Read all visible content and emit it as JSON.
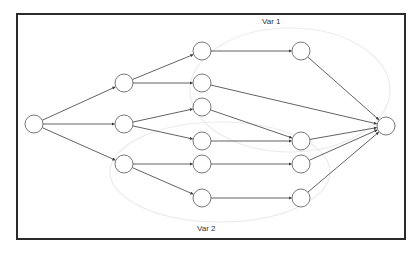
{
  "diagram": {
    "type": "directed-graph",
    "labels": {
      "group_top": "Var 1",
      "group_bottom": "Var 2"
    },
    "colors": {
      "frame": "#2b2b2b",
      "edge": "#3a3a3a",
      "node_stroke": "#555555",
      "node_fill": "#ffffff",
      "group_outline": "#ececec"
    },
    "node_radius": 9,
    "nodes": [
      {
        "id": "A",
        "x": 34,
        "y": 124
      },
      {
        "id": "B1",
        "x": 124,
        "y": 83
      },
      {
        "id": "B2",
        "x": 124,
        "y": 124
      },
      {
        "id": "B3",
        "x": 124,
        "y": 164
      },
      {
        "id": "C1",
        "x": 202,
        "y": 51
      },
      {
        "id": "C2",
        "x": 202,
        "y": 83
      },
      {
        "id": "C3",
        "x": 202,
        "y": 107
      },
      {
        "id": "C4",
        "x": 202,
        "y": 141
      },
      {
        "id": "C5",
        "x": 202,
        "y": 164
      },
      {
        "id": "C6",
        "x": 202,
        "y": 198
      },
      {
        "id": "D1",
        "x": 301,
        "y": 51
      },
      {
        "id": "D2",
        "x": 301,
        "y": 141
      },
      {
        "id": "D3",
        "x": 301,
        "y": 164
      },
      {
        "id": "D4",
        "x": 301,
        "y": 198
      },
      {
        "id": "E",
        "x": 386,
        "y": 126
      }
    ],
    "edges": [
      {
        "from": "A",
        "to": "B1"
      },
      {
        "from": "A",
        "to": "B2"
      },
      {
        "from": "A",
        "to": "B3"
      },
      {
        "from": "B1",
        "to": "C1"
      },
      {
        "from": "B1",
        "to": "C2"
      },
      {
        "from": "B2",
        "to": "C3"
      },
      {
        "from": "B2",
        "to": "C4"
      },
      {
        "from": "B3",
        "to": "C5"
      },
      {
        "from": "B3",
        "to": "C6"
      },
      {
        "from": "C1",
        "to": "D1"
      },
      {
        "from": "C2",
        "to": "E"
      },
      {
        "from": "C3",
        "to": "D2"
      },
      {
        "from": "C4",
        "to": "D2"
      },
      {
        "from": "C5",
        "to": "D3"
      },
      {
        "from": "C6",
        "to": "D4"
      },
      {
        "from": "D1",
        "to": "E"
      },
      {
        "from": "D2",
        "to": "E"
      },
      {
        "from": "D3",
        "to": "E"
      },
      {
        "from": "D4",
        "to": "E"
      }
    ],
    "groups": [
      {
        "label": "Var 1",
        "cx": 290,
        "cy": 90,
        "rx": 100,
        "ry": 62
      },
      {
        "label": "Var 2",
        "cx": 220,
        "cy": 172,
        "rx": 110,
        "ry": 50
      }
    ]
  }
}
